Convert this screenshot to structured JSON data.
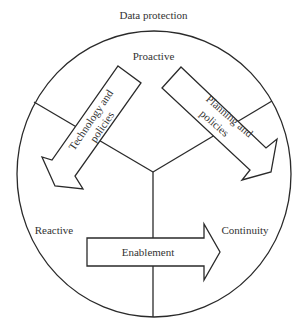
{
  "title": "Data protection",
  "quadrant_labels": {
    "top": "Proactive",
    "left": "Reactive",
    "right": "Continuity"
  },
  "arrows": {
    "left": {
      "line1": "Technology and",
      "line2": "policies",
      "direction": "down-left"
    },
    "right": {
      "line1": "Planning and",
      "line2": "policies",
      "direction": "down-right"
    },
    "bottom": {
      "label": "Enablement",
      "direction": "right"
    }
  },
  "colors": {
    "stroke": "#2a2a2a",
    "text": "#333333",
    "background": "#ffffff"
  }
}
